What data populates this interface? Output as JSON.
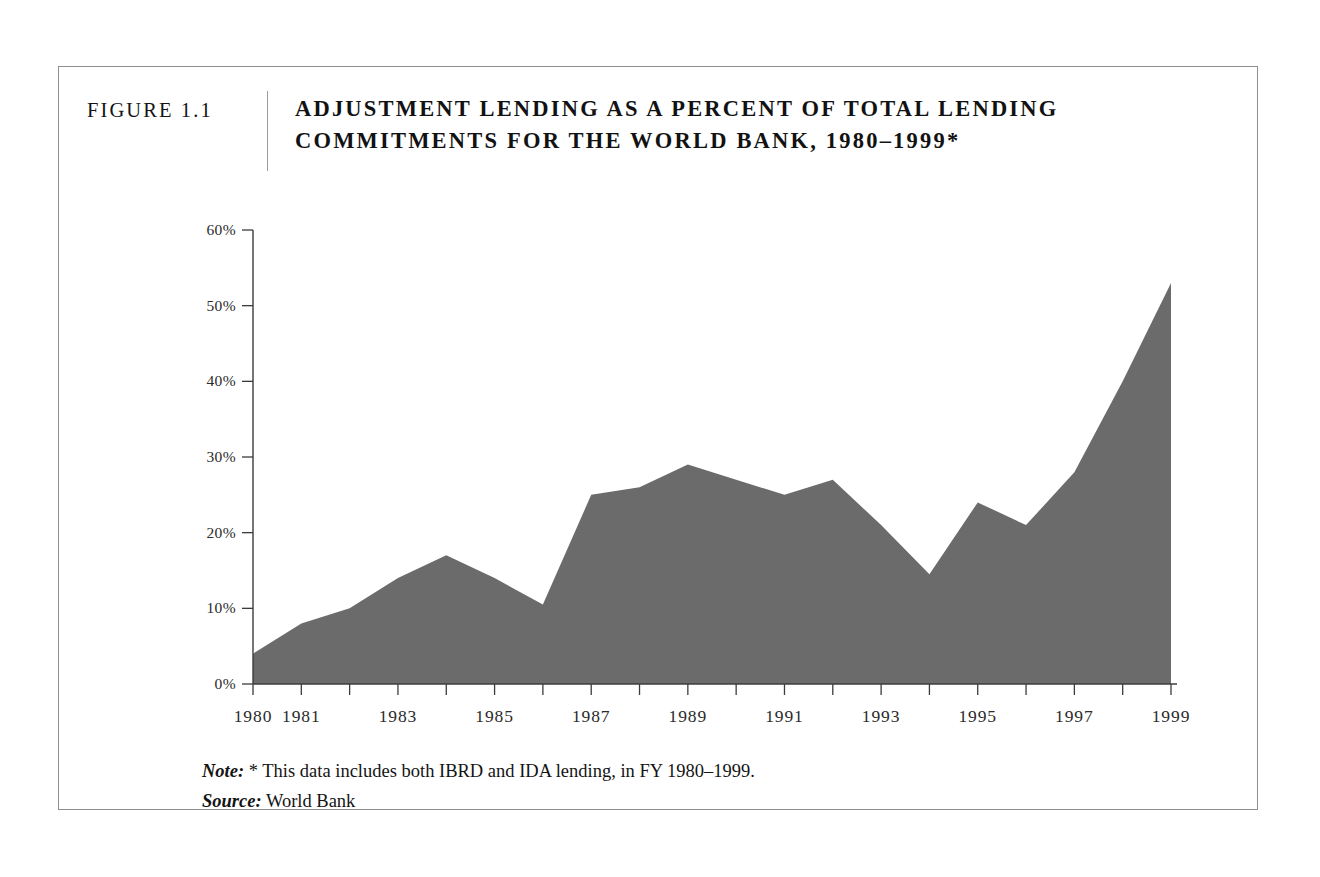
{
  "figure": {
    "number_label": "FIGURE 1.1",
    "title_line1": "ADJUSTMENT LENDING AS A PERCENT OF TOTAL LENDING",
    "title_line2": "COMMITMENTS FOR THE WORLD BANK, 1980–1999*"
  },
  "notes": {
    "note_lead": "Note:",
    "note_text": " * This data includes both IBRD and IDA lending, in FY 1980–1999.",
    "source_lead": "Source:",
    "source_text": " World Bank"
  },
  "colors": {
    "area_fill": "#6b6b6b",
    "axis": "#3c3c3c",
    "frame": "#8e8e90",
    "text": "#141414"
  },
  "chart_data": {
    "type": "area",
    "title": "ADJUSTMENT LENDING AS A PERCENT OF TOTAL LENDING COMMITMENTS FOR THE WORLD BANK, 1980–1999*",
    "xlabel": "",
    "ylabel": "",
    "grid": false,
    "legend": "none",
    "xlim": [
      1980,
      1999
    ],
    "ylim": [
      0,
      60
    ],
    "ytick_labels": [
      "0%",
      "10%",
      "20%",
      "30%",
      "40%",
      "50%",
      "60%"
    ],
    "ytick_values": [
      0,
      10,
      20,
      30,
      40,
      50,
      60
    ],
    "xtick_values": [
      1980,
      1981,
      1982,
      1983,
      1984,
      1985,
      1986,
      1987,
      1988,
      1989,
      1990,
      1991,
      1992,
      1993,
      1994,
      1995,
      1996,
      1997,
      1998,
      1999
    ],
    "xtick_labels": [
      "1980",
      "1981",
      "",
      "1983",
      "",
      "1985",
      "",
      "1987",
      "",
      "1989",
      "",
      "1991",
      "",
      "1993",
      "",
      "1995",
      "",
      "1997",
      "",
      "1999"
    ],
    "x": [
      1980,
      1981,
      1982,
      1983,
      1984,
      1985,
      1986,
      1987,
      1988,
      1989,
      1990,
      1991,
      1992,
      1993,
      1994,
      1995,
      1996,
      1997,
      1998,
      1999
    ],
    "values": [
      4,
      8,
      10,
      14,
      17,
      14,
      10.5,
      25,
      26,
      29,
      27,
      25,
      27,
      21,
      14.5,
      24,
      21,
      28,
      40,
      53
    ],
    "series": [
      {
        "name": "Adjustment lending share of total lending commitments",
        "unit": "percent",
        "values": [
          4,
          8,
          10,
          14,
          17,
          14,
          10.5,
          25,
          26,
          29,
          27,
          25,
          27,
          21,
          14.5,
          24,
          21,
          28,
          40,
          53
        ]
      }
    ]
  }
}
